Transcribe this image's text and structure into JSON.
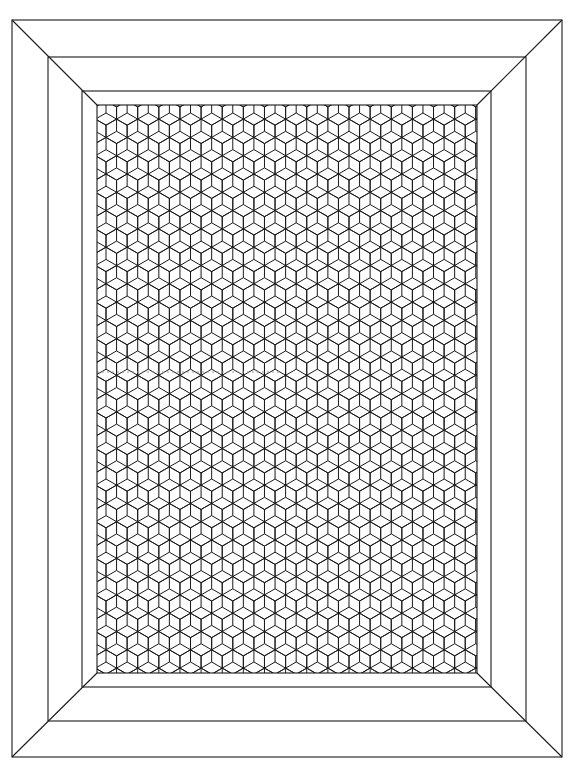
{
  "colors": {
    "background": "#ffffff",
    "line": "#1a1a1a",
    "faint_line": "#9a9a9a"
  },
  "frame": {
    "outer": {
      "x1": 12,
      "y1": 20,
      "x2": 562,
      "y2": 757
    },
    "middle": {
      "x1": 48,
      "y1": 57,
      "x2": 526,
      "y2": 721
    },
    "inner": {
      "x1": 82,
      "y1": 91,
      "x2": 491,
      "y2": 687
    },
    "pattern": {
      "x1": 97,
      "y1": 105,
      "x2": 477,
      "y2": 673
    }
  },
  "pattern": {
    "name": "tumbling-blocks",
    "hex_side": 12.2,
    "origin_x": 106,
    "origin_y": 113,
    "faint_row": {
      "y": 372,
      "x_start": 97,
      "x_end": 282
    }
  }
}
